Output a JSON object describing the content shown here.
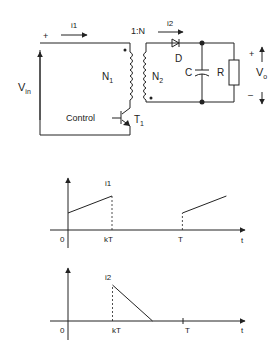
{
  "circuit": {
    "input_current": "i1",
    "output_current": "i2",
    "turns_ratio": "1:N",
    "primary_winding": "N",
    "primary_winding_sub": "1",
    "secondary_winding": "N",
    "secondary_winding_sub": "2",
    "diode": "D",
    "capacitor": "C",
    "resistor": "R",
    "input_voltage": "V",
    "input_voltage_sub": "in",
    "output_voltage": "V",
    "output_voltage_sub": "o",
    "plus": "+",
    "minus": "–",
    "control": "Control",
    "transistor": "T",
    "transistor_sub": "1"
  },
  "chart_data": [
    {
      "type": "line",
      "title": "i1",
      "xlabel": "t",
      "x_ticks": [
        "0",
        "kT",
        "T"
      ],
      "segments": [
        {
          "x": [
            0,
            1
          ],
          "y": [
            0.5,
            1.0
          ]
        },
        {
          "x": [
            1,
            1
          ],
          "y": [
            1.0,
            0
          ],
          "style": "dashed"
        },
        {
          "x": [
            2.6,
            2.6
          ],
          "y": [
            0,
            0.5
          ],
          "style": "dashed"
        },
        {
          "x": [
            2.6,
            3.6
          ],
          "y": [
            0.5,
            1.0
          ]
        }
      ],
      "x_tick_values": [
        0,
        1,
        2.6
      ]
    },
    {
      "type": "line",
      "title": "i2",
      "xlabel": "t",
      "x_ticks": [
        "0",
        "kT",
        "T"
      ],
      "segments": [
        {
          "x": [
            1,
            1
          ],
          "y": [
            0,
            1.0
          ],
          "style": "dashed"
        },
        {
          "x": [
            1,
            1.9
          ],
          "y": [
            1.0,
            0
          ]
        }
      ],
      "x_tick_values": [
        0,
        1,
        2.6
      ]
    }
  ]
}
